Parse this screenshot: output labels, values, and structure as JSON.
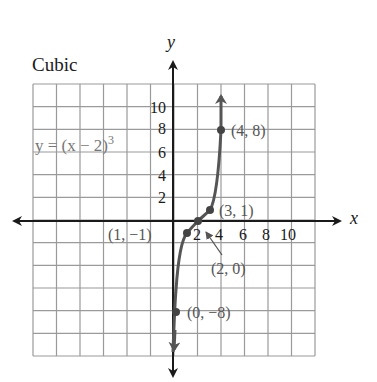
{
  "title": "Cubic",
  "equation": {
    "text": "y = (x − 2)",
    "exponent": "3"
  },
  "axes": {
    "x_label": "x",
    "y_label": "y"
  },
  "colors": {
    "axis": "#1a1a1a",
    "grid": "#9a9a9a",
    "curve": "#555555",
    "labels": "#555555"
  },
  "ticks": {
    "x": [
      "2",
      "4",
      "6",
      "8",
      "10"
    ],
    "y": [
      "2",
      "4",
      "6",
      "8",
      "10"
    ]
  },
  "points": [
    {
      "label": "(0, −8)",
      "x": 0,
      "y": -8
    },
    {
      "label": "(1, −1)",
      "x": 1,
      "y": -1
    },
    {
      "label": "(2, 0)",
      "x": 2,
      "y": 0
    },
    {
      "label": "(3, 1)",
      "x": 3,
      "y": 1
    },
    {
      "label": "(4, 8)",
      "x": 4,
      "y": 8
    }
  ],
  "chart_data": {
    "type": "line",
    "title": "Cubic",
    "function": "y = (x - 2)^3",
    "xlabel": "x",
    "ylabel": "y",
    "x": [
      0,
      1,
      2,
      3,
      4
    ],
    "values": [
      -8,
      -1,
      0,
      1,
      8
    ],
    "labeled_points": [
      "(0, -8)",
      "(1, -1)",
      "(2, 0)",
      "(3, 1)",
      "(4, 8)"
    ],
    "x_ticks": [
      2,
      4,
      6,
      8,
      10
    ],
    "y_ticks": [
      2,
      4,
      6,
      8,
      10
    ],
    "grid": true,
    "legend": "none"
  }
}
